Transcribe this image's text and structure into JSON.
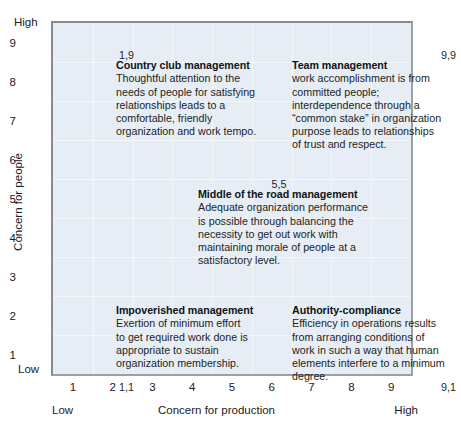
{
  "figure": {
    "name": "managerial-grid",
    "background_color": "#ffffff",
    "plot_fill": "#e7edf4",
    "plot_border": "#848b93",
    "gridline_color": "#f3f7fb"
  },
  "axes": {
    "y": {
      "title": "Concern for people",
      "high_label": "High",
      "low_label": "Low",
      "ticks": [
        "9",
        "8",
        "7",
        "6",
        "5",
        "4",
        "3",
        "2",
        "1"
      ],
      "tick_values": [
        9,
        8,
        7,
        6,
        5,
        4,
        3,
        2,
        1
      ],
      "range": [
        1,
        9
      ]
    },
    "x": {
      "title": "Concern for production",
      "low_label": "Low",
      "high_label": "High",
      "ticks": [
        "1",
        "2",
        "3",
        "4",
        "5",
        "6",
        "7",
        "8",
        "9"
      ],
      "tick_values": [
        1,
        2,
        3,
        4,
        5,
        6,
        7,
        8,
        9
      ],
      "range": [
        1,
        9
      ]
    }
  },
  "coordinates": {
    "top_left": "1,9",
    "top_right": "9,9",
    "center": "5,5",
    "bottom_left": "1,1",
    "bottom_right": "9,1"
  },
  "blocks": {
    "country_club": {
      "coord": "1,9",
      "title": "Country club management",
      "body": "Thoughtful attention to the\nneeds of people for satisfying\nrelationships leads to a\ncomfortable, friendly\norganization and work tempo."
    },
    "team": {
      "coord": "9,9",
      "title": "Team management",
      "body": "work accomplishment is from\ncommitted people;\ninterdependence through a\n“common stake” in organization\npurpose leads to relationships\nof trust and respect."
    },
    "middle_of_road": {
      "coord": "5,5",
      "title": "Middle of the road management",
      "body": "Adequate organization performance\nis possible through balancing the\nnecessity to get out work with\nmaintaining morale of people at a\nsatisfactory level."
    },
    "impoverished": {
      "coord": "1,1",
      "title": "Impoverished management",
      "body": "Exertion of minimum effort\nto get required work done is\nappropriate to sustain\norganization membership."
    },
    "authority_compliance": {
      "coord": "9,1",
      "title": "Authority-compliance",
      "body": "Efficiency in operations results\nfrom arranging conditions of\nwork in such a way that human\nelements interfere to a minimum\ndegree."
    }
  },
  "chart_data": {
    "type": "scatter",
    "title": "",
    "xlabel": "Concern for production",
    "ylabel": "Concern for people",
    "xlim": [
      0.5,
      9.5
    ],
    "ylim": [
      0.5,
      9.5
    ],
    "xticks": [
      1,
      2,
      3,
      4,
      5,
      6,
      7,
      8,
      9
    ],
    "yticks": [
      1,
      2,
      3,
      4,
      5,
      6,
      7,
      8,
      9
    ],
    "grid": true,
    "legend": "none",
    "points": [
      {
        "label": "1,9",
        "x": 1,
        "y": 9,
        "name": "Country club management"
      },
      {
        "label": "9,9",
        "x": 9,
        "y": 9,
        "name": "Team management"
      },
      {
        "label": "5,5",
        "x": 5,
        "y": 5,
        "name": "Middle of the road management"
      },
      {
        "label": "1,1",
        "x": 1,
        "y": 1,
        "name": "Impoverished management"
      },
      {
        "label": "9,1",
        "x": 9,
        "y": 1,
        "name": "Authority-compliance"
      }
    ],
    "annotations": [
      {
        "at": "1,9",
        "text": "Country club management"
      },
      {
        "at": "9,9",
        "text": "Team management"
      },
      {
        "at": "5,5",
        "text": "Middle of the road management"
      },
      {
        "at": "1,1",
        "text": "Impoverished management"
      },
      {
        "at": "9,1",
        "text": "Authority-compliance"
      }
    ]
  }
}
